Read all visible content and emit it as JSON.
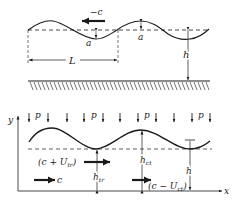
{
  "top_figure": {
    "wave_speed_label": "−c",
    "amplitude_label_1": "a",
    "amplitude_label_2": "a",
    "wavelength_label": "L",
    "depth_label": "h"
  },
  "bottom_figure": {
    "axis_y_label": "y",
    "axis_x_label": "x",
    "pressure_labels": [
      "p",
      "p",
      "p",
      "p"
    ],
    "trough_velocity_label": "(c + U",
    "trough_velocity_sub": "tr",
    "trough_velocity_close": ")",
    "frame_speed_label": "c",
    "trough_depth_label": "h",
    "trough_depth_sub": "tr",
    "crest_depth_label": "h",
    "crest_depth_sub": "ct",
    "crest_velocity_label": "(c − U",
    "crest_velocity_sub": "ct",
    "crest_velocity_close": ")",
    "mean_depth_label": "h"
  },
  "colors": {
    "ink": "#1a1a1a",
    "background": "#ffffff"
  }
}
